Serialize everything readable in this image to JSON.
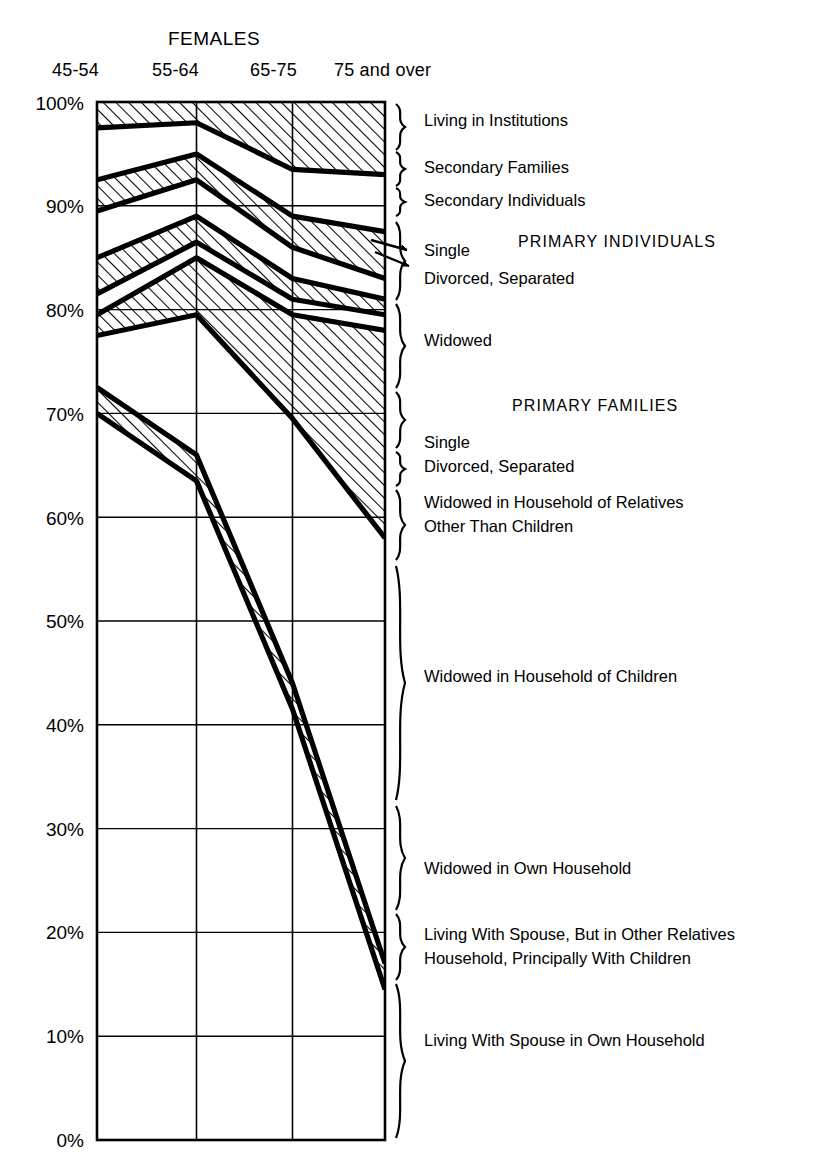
{
  "title": "FEMALES",
  "axis": {
    "x_categories": [
      "45-54",
      "55-64",
      "65-75",
      "75 and over"
    ],
    "y_ticks": [
      "100%",
      "90%",
      "80%",
      "70%",
      "60%",
      "50%",
      "40%",
      "30%",
      "20%",
      "10%",
      "0%"
    ],
    "ylim": [
      0,
      100
    ]
  },
  "group_headings": {
    "primary_individuals": "PRIMARY  INDIVIDUALS",
    "primary_families": "PRIMARY  FAMILIES"
  },
  "legend": {
    "institutions": "Living in Institutions",
    "secondary_families": "Secondary Families",
    "secondary_individuals": "Secondary Individuals",
    "pi_single": "Single",
    "pi_divorced": "Divorced, Separated",
    "pi_widowed": "Widowed",
    "pf_single": "Single",
    "pf_divorced": "Divorced, Separated",
    "pf_widowed_rel_1": "Widowed in Household of Relatives",
    "pf_widowed_rel_2": "Other Than Children",
    "pf_widowed_children": "Widowed in Household of Children",
    "pf_widowed_own": "Widowed in Own Household",
    "pf_spouse_other_1": "Living With Spouse, But in Other Relatives",
    "pf_spouse_other_2": "Household, Principally With Children",
    "pf_spouse_own": "Living With Spouse in Own Household"
  },
  "chart_data": {
    "type": "area",
    "title": "FEMALES",
    "xlabel": "",
    "ylabel": "",
    "ylim": [
      0,
      100
    ],
    "grid": true,
    "legend_position": "right",
    "stacking": "cumulative-percent",
    "categories": [
      "45-54",
      "55-64",
      "65-75",
      "75 and over"
    ],
    "note": "Values are cumulative upper boundaries (%) of each stacked band, read bottom-up.",
    "series": [
      {
        "name": "Living With Spouse in Own Household",
        "hatched": false,
        "values": [
          70.0,
          63.5,
          41.5,
          14.5
        ],
        "cumulative_top": [
          70.0,
          63.5,
          41.5,
          14.5
        ]
      },
      {
        "name": "Living With Spouse, But in Other Relatives Household, Principally With Children",
        "hatched": true,
        "values": [
          2.5,
          2.5,
          2.5,
          2.5
        ],
        "cumulative_top": [
          72.5,
          66.0,
          44.0,
          17.0
        ]
      },
      {
        "name": "Widowed in Own Household",
        "hatched": false,
        "values": [
          5.0,
          13.5,
          25.5,
          41.0
        ],
        "cumulative_top": [
          77.5,
          79.5,
          69.5,
          58.0
        ]
      },
      {
        "name": "Widowed in Household of Children",
        "hatched": true,
        "values": [
          2.0,
          5.5,
          10.0,
          20.0
        ],
        "cumulative_top": [
          79.5,
          85.0,
          79.5,
          78.0
        ]
      },
      {
        "name": "Widowed in Household of Relatives Other Than Children",
        "hatched": false,
        "values": [
          2.0,
          1.5,
          1.5,
          1.5
        ],
        "cumulative_top": [
          81.5,
          86.5,
          81.0,
          79.5
        ]
      },
      {
        "name": "Divorced, Separated — Primary Families",
        "hatched": true,
        "values": [
          3.5,
          2.5,
          2.0,
          1.5
        ],
        "cumulative_top": [
          85.0,
          89.0,
          83.0,
          81.0
        ]
      },
      {
        "name": "Single — Primary Families",
        "hatched": false,
        "values": [
          4.5,
          3.5,
          3.0,
          2.0
        ],
        "cumulative_top": [
          89.5,
          92.5,
          86.0,
          83.0
        ]
      },
      {
        "name": "Secondary Individuals",
        "hatched": true,
        "values": [
          3.0,
          2.5,
          3.0,
          4.5
        ],
        "cumulative_top": [
          92.5,
          95.0,
          89.0,
          87.5
        ]
      },
      {
        "name": "Secondary Families",
        "hatched": false,
        "values": [
          5.0,
          3.0,
          4.5,
          5.5
        ],
        "cumulative_top": [
          97.5,
          98.0,
          93.5,
          93.0
        ]
      },
      {
        "name": "Living in Institutions",
        "hatched": true,
        "values": [
          2.5,
          2.0,
          6.5,
          7.0
        ],
        "cumulative_top": [
          100.0,
          100.0,
          100.0,
          100.0
        ]
      }
    ]
  }
}
